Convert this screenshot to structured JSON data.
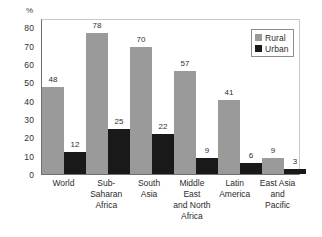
{
  "chart_data": {
    "type": "bar",
    "title": "",
    "xlabel": "",
    "ylabel": "%",
    "ylim": [
      0,
      85
    ],
    "yticks": [
      80,
      70,
      60,
      50,
      40,
      30,
      20,
      10,
      0
    ],
    "grid": false,
    "legend_position": "top-right",
    "categories": [
      "World",
      "Sub-Saharan Africa",
      "South Asia",
      "Middle East and North Africa",
      "Latin America",
      "East Asia and Pacific"
    ],
    "category_lines": [
      [
        "World"
      ],
      [
        "Sub-",
        "Saharan",
        "Africa"
      ],
      [
        "South",
        "Asia"
      ],
      [
        "Middle East",
        "and North",
        "Africa"
      ],
      [
        "Latin",
        "America"
      ],
      [
        "East Asia",
        "and Pacific"
      ]
    ],
    "series": [
      {
        "name": "Rural",
        "color": "#9a9a9a",
        "values": [
          48,
          78,
          70,
          57,
          41,
          9
        ]
      },
      {
        "name": "Urban",
        "color": "#191919",
        "values": [
          12,
          25,
          22,
          9,
          6,
          3
        ]
      }
    ]
  },
  "legend": {
    "items": [
      {
        "label": "Rural",
        "swatch": "rural"
      },
      {
        "label": "Urban",
        "swatch": "urban"
      }
    ]
  },
  "colors": {
    "rural": "#9a9a9a",
    "urban": "#191919",
    "axis": "#6f6f6f",
    "frame_light": "#c9c9c9",
    "text": "#2b2b2b",
    "background": "#ffffff"
  }
}
